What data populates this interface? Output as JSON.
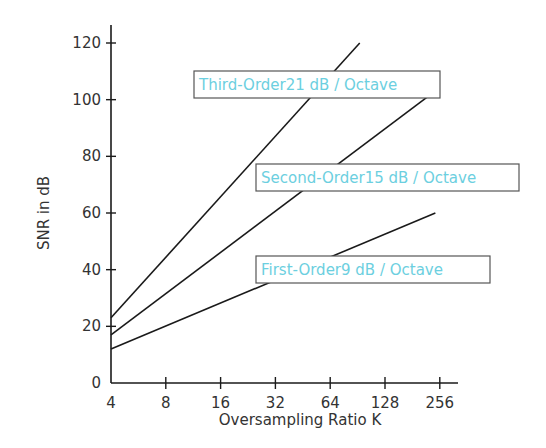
{
  "chart_data": {
    "type": "line",
    "title": "",
    "xlabel": "Oversampling Ratio K",
    "ylabel": "SNR in dB",
    "xscale": "log2",
    "x_ticks": [
      4,
      8,
      16,
      32,
      64,
      128,
      256
    ],
    "x_tick_labels": [
      "4",
      "8",
      "16",
      "32",
      "64",
      "128",
      "256"
    ],
    "y_ticks": [
      0,
      20,
      40,
      60,
      80,
      100,
      120
    ],
    "y_tick_labels": [
      "0",
      "20",
      "40",
      "60",
      "80",
      "100",
      "120"
    ],
    "xlim": [
      4,
      256
    ],
    "ylim": [
      0,
      120
    ],
    "grid": false,
    "series": [
      {
        "name": "Third-Order",
        "slope_label": "21 dB / Octave",
        "x": [
          4,
          93
        ],
        "values": [
          23,
          120
        ]
      },
      {
        "name": "Second-Order",
        "slope_label": "15 dB / Octave",
        "x": [
          4,
          219
        ],
        "values": [
          17,
          101
        ]
      },
      {
        "name": "First-Order",
        "slope_label": "9 dB / Octave",
        "x": [
          4,
          242
        ],
        "values": [
          12,
          60
        ]
      }
    ],
    "annotations": [
      {
        "text": "Third-Order21 dB / Octave",
        "series": "Third-Order"
      },
      {
        "text": "Second-Order15 dB / Octave",
        "series": "Second-Order"
      },
      {
        "text": "First-Order9 dB / Octave",
        "series": "First-Order"
      }
    ],
    "colors": {
      "line": "#1a1a1a",
      "axis": "#1a1a1a",
      "annotation_text": "#6ccfe0",
      "annotation_border": "#555555"
    }
  }
}
